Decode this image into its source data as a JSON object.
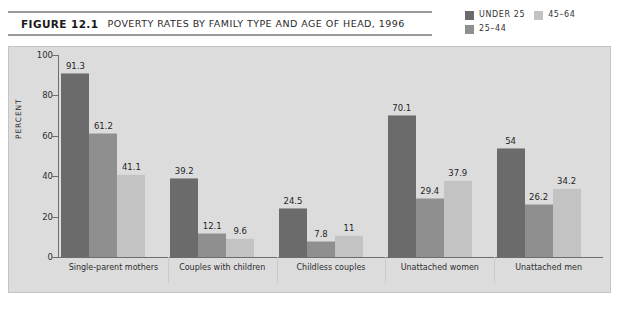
{
  "figure": {
    "number": "FIGURE 12.1",
    "title": "POVERTY RATES BY FAMILY TYPE AND AGE OF HEAD, 1996"
  },
  "legend": {
    "position": "top-right",
    "entries": [
      {
        "label": "UNDER 25",
        "color": "#6b6b6b"
      },
      {
        "label": "45–64",
        "color": "#c3c3c3"
      },
      {
        "label": "25–44",
        "color": "#8f8f8f"
      }
    ]
  },
  "axes": {
    "ylabel": "PERCENT",
    "yticks": [
      "0",
      "20",
      "40",
      "60",
      "80",
      "100"
    ]
  },
  "colors": {
    "panel_background": "#dcdcdc",
    "page_background": "#ffffff",
    "axis_line": "#6d6d6d",
    "series_under_25": "#6b6b6b",
    "series_25_44": "#8f8f8f",
    "series_45_64": "#c3c3c3"
  },
  "chart_data": {
    "type": "bar",
    "title": "POVERTY RATES BY FAMILY TYPE AND AGE OF HEAD, 1996",
    "xlabel": "",
    "ylabel": "PERCENT",
    "ylim": [
      0,
      100
    ],
    "ytick_step": 20,
    "grid": false,
    "legend_position": "top-right",
    "categories": [
      "Single-parent mothers",
      "Couples with children",
      "Childless couples",
      "Unattached women",
      "Unattached men"
    ],
    "series": [
      {
        "name": "UNDER 25",
        "color": "#6b6b6b",
        "values": [
          91.3,
          39.2,
          24.5,
          70.1,
          54
        ]
      },
      {
        "name": "25–44",
        "color": "#8f8f8f",
        "values": [
          61.2,
          12.1,
          7.8,
          29.4,
          26.2
        ]
      },
      {
        "name": "45–64",
        "color": "#c3c3c3",
        "values": [
          41.1,
          9.6,
          11,
          37.9,
          34.2
        ]
      }
    ],
    "value_labels": [
      [
        "91.3",
        "61.2",
        "41.1"
      ],
      [
        "39.2",
        "12.1",
        "9.6"
      ],
      [
        "24.5",
        "7.8",
        "11"
      ],
      [
        "70.1",
        "29.4",
        "37.9"
      ],
      [
        "54",
        "26.2",
        "34.2"
      ]
    ]
  }
}
